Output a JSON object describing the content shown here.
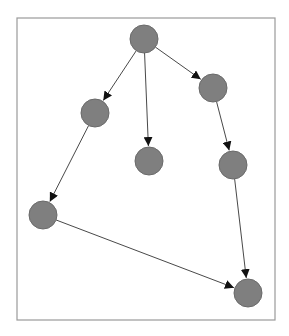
{
  "diagram": {
    "type": "directed-graph",
    "frame": {
      "x": 17,
      "y": 18,
      "width": 258,
      "height": 302,
      "stroke": "#9a9a9a"
    },
    "node_style": {
      "fill": "#7f7f7f",
      "stroke": "#6a6a6a",
      "radius": 14
    },
    "edge_color": "#333333",
    "nodes": [
      {
        "id": "n1",
        "x": 144,
        "y": 39
      },
      {
        "id": "n2",
        "x": 213,
        "y": 88
      },
      {
        "id": "n3",
        "x": 95,
        "y": 113
      },
      {
        "id": "n4",
        "x": 149,
        "y": 161
      },
      {
        "id": "n5",
        "x": 233,
        "y": 165
      },
      {
        "id": "n6",
        "x": 43,
        "y": 215
      },
      {
        "id": "n7",
        "x": 248,
        "y": 293
      }
    ],
    "edges": [
      {
        "from": "n1",
        "to": "n3"
      },
      {
        "from": "n1",
        "to": "n4"
      },
      {
        "from": "n1",
        "to": "n2"
      },
      {
        "from": "n2",
        "to": "n5"
      },
      {
        "from": "n3",
        "to": "n6"
      },
      {
        "from": "n5",
        "to": "n7"
      },
      {
        "from": "n6",
        "to": "n7"
      }
    ]
  }
}
